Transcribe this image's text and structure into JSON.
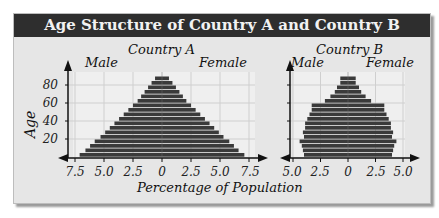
{
  "title": "Age Structure of Country A and Country B",
  "axis_title_y": "Age",
  "axis_title_x": "Percentage of Population",
  "colors": {
    "bar": "#3a3a3a",
    "title_bg": "#2e2e2e",
    "panel_bg": "#e6e6e6",
    "grid": "#c8c8c8"
  },
  "chart_data": [
    {
      "type": "bar",
      "subtype": "population-pyramid",
      "title": "Country A",
      "left_label": "Male",
      "right_label": "Female",
      "ylabel": "Age",
      "xlabel": "Percentage of Population",
      "y_ticks": [
        20,
        40,
        60,
        80
      ],
      "x_ticks": [
        "7.5",
        "5.0",
        "2.5",
        "0",
        "2.5",
        "5.0",
        "7.5"
      ],
      "xlim": [
        -7.5,
        7.5
      ],
      "categories": [
        "0-4",
        "5-9",
        "10-14",
        "15-19",
        "20-24",
        "25-29",
        "30-34",
        "35-39",
        "40-44",
        "45-49",
        "50-54",
        "55-59",
        "60-64",
        "65-69",
        "70-74",
        "75-79",
        "80-84",
        "85-89"
      ],
      "series": [
        {
          "name": "Male",
          "values": [
            7.1,
            6.6,
            6.2,
            5.8,
            5.3,
            4.9,
            4.5,
            4.1,
            3.7,
            3.3,
            2.9,
            2.5,
            2.1,
            1.8,
            1.5,
            1.2,
            0.9,
            0.6
          ]
        },
        {
          "name": "Female",
          "values": [
            7.1,
            6.6,
            6.2,
            5.8,
            5.3,
            4.9,
            4.5,
            4.1,
            3.7,
            3.3,
            2.9,
            2.5,
            2.1,
            1.8,
            1.5,
            1.2,
            0.9,
            0.6
          ]
        }
      ],
      "grid": true
    },
    {
      "type": "bar",
      "subtype": "population-pyramid",
      "title": "Country B",
      "left_label": "Male",
      "right_label": "Female",
      "ylabel": "Age",
      "xlabel": "Percentage of Population",
      "y_ticks": [
        20,
        40,
        60,
        80
      ],
      "x_ticks": [
        "5.0",
        "2.5",
        "0",
        "2.5",
        "5.0"
      ],
      "xlim": [
        -5.0,
        5.0
      ],
      "categories": [
        "0-4",
        "5-9",
        "10-14",
        "15-19",
        "20-24",
        "25-29",
        "30-34",
        "35-39",
        "40-44",
        "45-49",
        "50-54",
        "55-59",
        "60-64",
        "65-69",
        "70-74",
        "75-79",
        "80-84",
        "85-89"
      ],
      "series": [
        {
          "name": "Male",
          "values": [
            4.0,
            4.1,
            4.2,
            4.4,
            4.0,
            4.1,
            3.9,
            3.9,
            3.7,
            3.5,
            3.3,
            3.3,
            2.1,
            1.6,
            1.2,
            1.0,
            0.7,
            0.7
          ]
        },
        {
          "name": "Female",
          "values": [
            4.0,
            4.1,
            4.2,
            4.4,
            4.0,
            4.1,
            3.9,
            3.9,
            3.7,
            3.5,
            3.3,
            3.3,
            2.1,
            1.6,
            1.2,
            1.0,
            0.7,
            0.7
          ]
        }
      ],
      "grid": true
    }
  ]
}
